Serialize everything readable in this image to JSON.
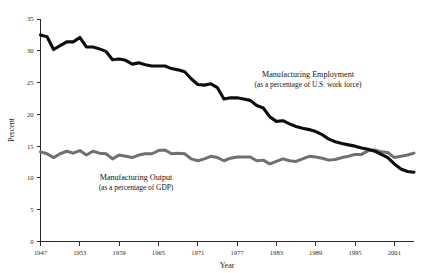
{
  "chart_data": {
    "type": "line",
    "title": "",
    "xlabel": "Year",
    "ylabel": "Percent",
    "xlim": [
      1947,
      2004
    ],
    "ylim": [
      0,
      35
    ],
    "grid": false,
    "legend_position": "inline-annotations",
    "xticks": [
      1947,
      1953,
      1959,
      1965,
      1971,
      1977,
      1983,
      1989,
      1995,
      2001
    ],
    "yticks": [
      0,
      5,
      10,
      15,
      20,
      25,
      30,
      35
    ],
    "x": [
      1947,
      1948,
      1949,
      1950,
      1951,
      1952,
      1953,
      1954,
      1955,
      1956,
      1957,
      1958,
      1959,
      1960,
      1961,
      1962,
      1963,
      1964,
      1965,
      1966,
      1967,
      1968,
      1969,
      1970,
      1971,
      1972,
      1973,
      1974,
      1975,
      1976,
      1977,
      1978,
      1979,
      1980,
      1981,
      1982,
      1983,
      1984,
      1985,
      1986,
      1987,
      1988,
      1989,
      1990,
      1991,
      1992,
      1993,
      1994,
      1995,
      1996,
      1997,
      1998,
      1999,
      2000,
      2001,
      2002,
      2003,
      2004
    ],
    "series": [
      {
        "name": "Manufacturing Employment",
        "label_line1": "Manufacturing Employment",
        "label_line2": "(as a percentage of U.S. work force)",
        "color": "#0d0d0d",
        "units": "percent of U.S. work force",
        "values": [
          32.5,
          32.2,
          30.2,
          30.8,
          31.4,
          31.4,
          32.1,
          30.6,
          30.6,
          30.3,
          29.9,
          28.6,
          28.7,
          28.5,
          27.9,
          28.1,
          27.8,
          27.6,
          27.6,
          27.6,
          27.2,
          27.0,
          26.7,
          25.6,
          24.7,
          24.6,
          24.8,
          24.2,
          22.4,
          22.6,
          22.6,
          22.4,
          22.2,
          21.4,
          21.0,
          19.6,
          18.9,
          19.0,
          18.5,
          18.1,
          17.8,
          17.6,
          17.3,
          16.8,
          16.1,
          15.7,
          15.4,
          15.2,
          15.0,
          14.7,
          14.5,
          14.2,
          13.7,
          13.2,
          12.2,
          11.4,
          11.0,
          10.9
        ]
      },
      {
        "name": "Manufacturing Output",
        "label_line1": "Manufacturing Output",
        "label_line2": "(as a percentage of GDP)",
        "color": "#707070",
        "units": "percent of GDP",
        "values": [
          14.1,
          13.8,
          13.2,
          13.8,
          14.2,
          13.9,
          14.3,
          13.6,
          14.2,
          13.9,
          13.8,
          13.0,
          13.6,
          13.4,
          13.2,
          13.6,
          13.8,
          13.8,
          14.3,
          14.4,
          13.8,
          13.9,
          13.8,
          13.0,
          12.7,
          13.0,
          13.4,
          13.2,
          12.7,
          13.1,
          13.3,
          13.3,
          13.3,
          12.7,
          12.8,
          12.2,
          12.6,
          13.0,
          12.7,
          12.6,
          13.0,
          13.4,
          13.3,
          13.1,
          12.8,
          12.9,
          13.2,
          13.4,
          13.7,
          13.7,
          14.3,
          14.4,
          14.1,
          14.0,
          13.2,
          13.4,
          13.6,
          13.9
        ]
      }
    ]
  },
  "annotations": {
    "employment": {
      "line1": "Manufacturing Employment",
      "line2": "(as a percentage of U.S. work force)"
    },
    "output": {
      "line1": "Manufacturing Output",
      "line2": "(as a percentage of GDP)"
    }
  },
  "axis": {
    "y_title": "Percent",
    "x_title": "Year",
    "y_tick_labels": [
      "0",
      "5",
      "10",
      "15",
      "20",
      "25",
      "30",
      "35"
    ],
    "x_tick_labels": [
      "1947",
      "1953",
      "1959",
      "1965",
      "1971",
      "1977",
      "1983",
      "1989",
      "1995",
      "2001"
    ]
  }
}
